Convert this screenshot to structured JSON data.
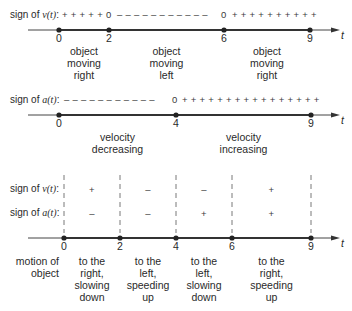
{
  "row1": {
    "label_prefix": "sign of ",
    "label_func": "v(t)",
    "label_suffix": ":",
    "signs": "+ + + + + 0 – – – – – – – – – – – 0 + + + + + + + + + +",
    "signs_parts": [
      {
        "text": "+ + + + +",
        "kind": "plus"
      },
      {
        "text": "0",
        "kind": "zero"
      },
      {
        "text": "– – – – – – – – – – –",
        "kind": "minus"
      },
      {
        "text": "0",
        "kind": "zero"
      },
      {
        "text": "+ + + + + + + + + +",
        "kind": "plus"
      }
    ],
    "axis_variable": "t",
    "ticks": [
      {
        "t": 0,
        "label": "0"
      },
      {
        "t": 2,
        "label": "2"
      },
      {
        "t": 6,
        "label": "6"
      },
      {
        "t": 9,
        "label": "9"
      }
    ],
    "intervals": [
      {
        "from": 0,
        "to": 2,
        "lines": [
          "object",
          "moving",
          "right"
        ]
      },
      {
        "from": 2,
        "to": 6,
        "lines": [
          "object",
          "moving",
          "left"
        ]
      },
      {
        "from": 6,
        "to": 9,
        "lines": [
          "object",
          "moving",
          "right"
        ]
      }
    ]
  },
  "row2": {
    "label_prefix": "sign of ",
    "label_func": "a(t)",
    "label_suffix": ":",
    "signs_parts": [
      {
        "text": "– – – – – – – – – – –",
        "kind": "minus"
      },
      {
        "text": "0",
        "kind": "zero"
      },
      {
        "text": "+ + + + + + + + + + + + + + + +",
        "kind": "plus"
      }
    ],
    "axis_variable": "t",
    "ticks": [
      {
        "t": 0,
        "label": "0"
      },
      {
        "t": 4,
        "label": "4"
      },
      {
        "t": 9,
        "label": "9"
      }
    ],
    "intervals": [
      {
        "from": 0,
        "to": 4,
        "lines": [
          "velocity",
          "decreasing"
        ]
      },
      {
        "from": 4,
        "to": 9,
        "lines": [
          "velocity",
          "increasing"
        ]
      }
    ]
  },
  "row3": {
    "v_label_prefix": "sign of ",
    "v_label_func": "v(t)",
    "a_label_prefix": "sign of ",
    "a_label_func": "a(t)",
    "label_suffix": ":",
    "motion_label": [
      "motion of",
      "object"
    ],
    "axis_variable": "t",
    "ticks": [
      {
        "t": 0,
        "label": "0"
      },
      {
        "t": 2,
        "label": "2"
      },
      {
        "t": 4,
        "label": "4"
      },
      {
        "t": 6,
        "label": "6"
      },
      {
        "t": 9,
        "label": "9"
      }
    ],
    "intervals": [
      {
        "from": 0,
        "to": 2,
        "v_sign": "+",
        "a_sign": "–",
        "motion": [
          "to the",
          "right,",
          "slowing",
          "down"
        ]
      },
      {
        "from": 2,
        "to": 4,
        "v_sign": "–",
        "a_sign": "–",
        "motion": [
          "to the",
          "left,",
          "speeding",
          "up"
        ]
      },
      {
        "from": 4,
        "to": 6,
        "v_sign": "–",
        "a_sign": "+",
        "motion": [
          "to the",
          "left,",
          "slowing",
          "down"
        ]
      },
      {
        "from": 6,
        "to": 9,
        "v_sign": "+",
        "a_sign": "+",
        "motion": [
          "to the",
          "right,",
          "speeding",
          "up"
        ]
      }
    ]
  }
}
